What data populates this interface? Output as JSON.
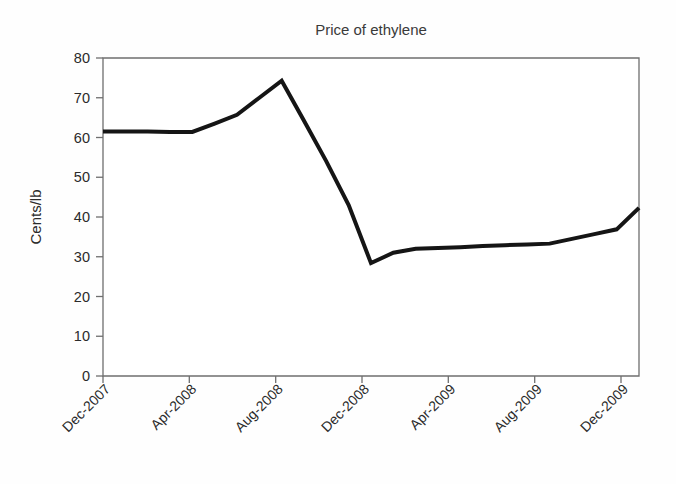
{
  "figure": {
    "width": 676,
    "height": 484,
    "background_color": "#fefefe"
  },
  "chart_data": {
    "type": "line",
    "title": "Price of ethylene",
    "xlabel": "",
    "ylabel": "Cents/lb",
    "ylim": [
      0,
      80
    ],
    "ytick_labels": [
      "0",
      "10",
      "20",
      "30",
      "40",
      "50",
      "60",
      "70",
      "80"
    ],
    "ytick_values": [
      0,
      10,
      20,
      30,
      40,
      50,
      60,
      70,
      80
    ],
    "xtick_labels": [
      "Dec-2007",
      "Apr-2008",
      "Aug-2008",
      "Dec-2008",
      "Apr-2009",
      "Aug-2009",
      "Dec-2009"
    ],
    "xtick_index": [
      0,
      4,
      8,
      12,
      16,
      20,
      24
    ],
    "xlim_index": [
      0,
      24
    ],
    "grid": false,
    "legend": "none",
    "line_color": "#151515",
    "line_width": 4,
    "x": [
      "Dec-2007",
      "Jan-2008",
      "Feb-2008",
      "Mar-2008",
      "Apr-2008",
      "May-2008",
      "Jun-2008",
      "Jul-2008",
      "Aug-2008",
      "Sep-2008",
      "Oct-2008",
      "Nov-2008",
      "Dec-2008",
      "Jan-2009",
      "Feb-2009",
      "Mar-2009",
      "Apr-2009",
      "May-2009",
      "Jun-2009",
      "Jul-2009",
      "Aug-2009",
      "Sep-2009",
      "Oct-2009",
      "Nov-2009",
      "Dec-2009"
    ],
    "values": [
      61.5,
      61.5,
      61.5,
      61.4,
      61.4,
      63.5,
      65.7,
      70.0,
      74.3,
      64.2,
      54.0,
      43.0,
      28.4,
      31.0,
      32.0,
      32.2,
      32.4,
      32.7,
      32.9,
      33.1,
      33.3,
      34.5,
      35.7,
      36.9,
      42.3
    ]
  }
}
